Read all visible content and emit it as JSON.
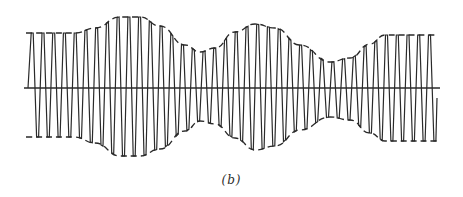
{
  "figure": {
    "caption": "(b)",
    "colors": {
      "stroke": "#2a2a2a",
      "background": "#ffffff"
    },
    "axis": {
      "y": 88,
      "x_start": 24,
      "x_end": 440
    },
    "envelope": {
      "style": "dashed",
      "upper": [
        [
          26,
          33
        ],
        [
          75,
          33
        ],
        [
          95,
          28
        ],
        [
          120,
          17
        ],
        [
          140,
          17
        ],
        [
          160,
          26
        ],
        [
          185,
          45
        ],
        [
          200,
          52
        ],
        [
          215,
          48
        ],
        [
          235,
          32
        ],
        [
          255,
          24
        ],
        [
          275,
          28
        ],
        [
          300,
          45
        ],
        [
          330,
          62
        ],
        [
          350,
          58
        ],
        [
          370,
          44
        ],
        [
          385,
          35
        ],
        [
          437,
          35
        ]
      ],
      "lower": [
        [
          26,
          137
        ],
        [
          75,
          137
        ],
        [
          95,
          143
        ],
        [
          120,
          156
        ],
        [
          140,
          156
        ],
        [
          160,
          149
        ],
        [
          185,
          131
        ],
        [
          200,
          121
        ],
        [
          215,
          124
        ],
        [
          235,
          138
        ],
        [
          255,
          150
        ],
        [
          275,
          146
        ],
        [
          300,
          130
        ],
        [
          330,
          117
        ],
        [
          350,
          120
        ],
        [
          370,
          133
        ],
        [
          385,
          141
        ],
        [
          437,
          141
        ]
      ]
    },
    "carrier": {
      "cycles": 38,
      "x_start": 28,
      "x_end": 436
    }
  }
}
